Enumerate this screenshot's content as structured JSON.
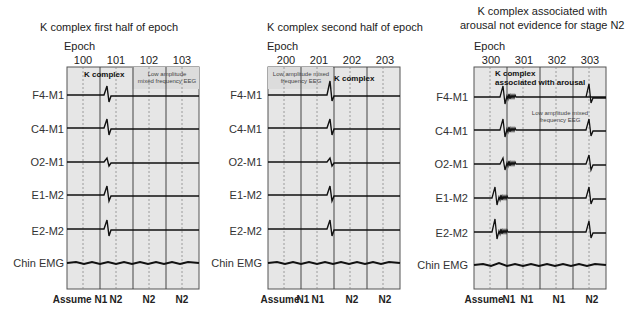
{
  "colors": {
    "panel_bg": "#e6e6e6",
    "shaded_bg": "#dcdcdc",
    "trace": "#111111",
    "grid": "#666666"
  },
  "channels": [
    "F4-M1",
    "C4-M1",
    "O2-M1",
    "E1-M2",
    "E2-M2",
    "Chin EMG"
  ],
  "epoch_label": "Epoch",
  "panels": [
    {
      "title": "K complex first half of epoch",
      "epochs": [
        "100",
        "101",
        "102",
        "103"
      ],
      "stages": [
        "Assume N1",
        "N2",
        "N2",
        "N2"
      ],
      "annotations": {
        "bold": "K complex",
        "small_1": "Low amplitude",
        "small_2": "mixed frequency EEG"
      }
    },
    {
      "title": "K complex second half of epoch",
      "epochs": [
        "200",
        "201",
        "202",
        "203"
      ],
      "stages": [
        "Assume",
        "N1",
        "N1",
        "N2",
        "N2"
      ],
      "annotations": {
        "bold": "K complex",
        "small_1": "Low amplitude mixed",
        "small_2": "frequency EEG"
      }
    },
    {
      "title_1": "K complex associated with",
      "title_2": "arousal not evidence for stage N2",
      "epochs": [
        "300",
        "301",
        "302",
        "303"
      ],
      "stages": [
        "Assume",
        "N1",
        "N1",
        "N1",
        "N2"
      ],
      "annotations": {
        "bold_1": "K complex",
        "bold_2": "associated with arousal",
        "small_1": "Low amplitude mixed",
        "small_2": "frequency EEG"
      }
    }
  ]
}
